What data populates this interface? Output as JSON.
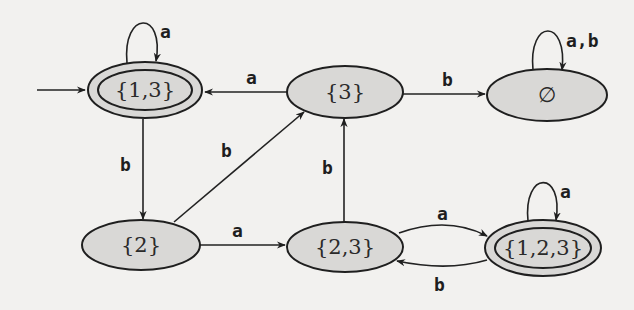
{
  "diagram": {
    "type": "finite-automaton",
    "states": [
      {
        "id": "s13",
        "label": "{1,3}",
        "accepting": true,
        "initial": true,
        "cx": 145,
        "cy": 90,
        "rx": 58,
        "ry": 28
      },
      {
        "id": "s3",
        "label": "{3}",
        "accepting": false,
        "initial": false,
        "cx": 345,
        "cy": 92,
        "rx": 58,
        "ry": 26
      },
      {
        "id": "sEmpty",
        "label": "∅",
        "accepting": false,
        "initial": false,
        "cx": 547,
        "cy": 95,
        "rx": 60,
        "ry": 26
      },
      {
        "id": "s2",
        "label": "{2}",
        "accepting": false,
        "initial": false,
        "cx": 141,
        "cy": 245,
        "rx": 59,
        "ry": 25
      },
      {
        "id": "s23",
        "label": "{2,3}",
        "accepting": false,
        "initial": false,
        "cx": 345,
        "cy": 247,
        "rx": 58,
        "ry": 25
      },
      {
        "id": "s123",
        "label": "{1,2,3}",
        "accepting": true,
        "initial": false,
        "cx": 543,
        "cy": 248,
        "rx": 58,
        "ry": 28
      }
    ],
    "transitions": [
      {
        "from": "s13",
        "to": "s13",
        "label": "a"
      },
      {
        "from": "s13",
        "to": "s2",
        "label": "b"
      },
      {
        "from": "s3",
        "to": "s13",
        "label": "a"
      },
      {
        "from": "s3",
        "to": "sEmpty",
        "label": "b"
      },
      {
        "from": "sEmpty",
        "to": "sEmpty",
        "label": "a,b"
      },
      {
        "from": "s2",
        "to": "s3",
        "label": "b"
      },
      {
        "from": "s2",
        "to": "s23",
        "label": "a"
      },
      {
        "from": "s23",
        "to": "s3",
        "label": "b"
      },
      {
        "from": "s23",
        "to": "s123",
        "label": "a"
      },
      {
        "from": "s123",
        "to": "s23",
        "label": "b"
      },
      {
        "from": "s123",
        "to": "s123",
        "label": "a"
      }
    ]
  },
  "labels": {
    "s13": "{1,3}",
    "s3": "{3}",
    "sEmpty": "∅",
    "s2": "{2}",
    "s23": "{2,3}",
    "s123": "{1,2,3}",
    "loop_s13": "a",
    "e_s13_s2": "b",
    "e_s3_s13": "a",
    "e_s3_sEmpty": "b",
    "loop_sEmpty": "a,b",
    "e_s2_s3": "b",
    "e_s2_s23": "a",
    "e_s23_s3": "b",
    "e_s23_s123": "a",
    "e_s123_s23": "b",
    "loop_s123": "a"
  },
  "colors": {
    "background": "#f2f1ef",
    "state_fill": "#d9d8d6",
    "stroke": "#1f1f1f"
  }
}
